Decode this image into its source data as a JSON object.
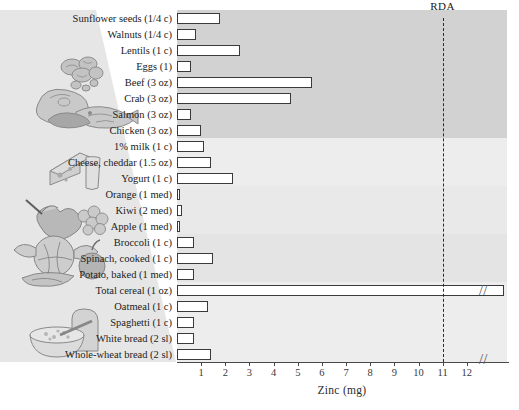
{
  "chart_data": {
    "type": "bar",
    "orientation": "horizontal",
    "title": "",
    "xlabel": "Zinc (mg)",
    "ylabel": "",
    "xlim": [
      0,
      13
    ],
    "xticks": [
      1,
      2,
      3,
      4,
      5,
      6,
      7,
      8,
      9,
      10,
      11,
      12
    ],
    "grid": false,
    "legend": null,
    "axis_break": true,
    "axis_break_note": "//",
    "annotations": [
      {
        "label": "RDA",
        "type": "vertical-line",
        "value": 11,
        "style": "dashed"
      }
    ],
    "categories": [
      "Sunflower seeds (1/4 c)",
      "Walnuts (1/4 c)",
      "Lentils (1 c)",
      "Eggs (1)",
      "Beef (3 oz)",
      "Crab (3 oz)",
      "Salmon (3 oz)",
      "Chicken (3 oz)",
      "1% milk (1 c)",
      "Cheese, cheddar (1.5 oz)",
      "Yogurt (1 c)",
      "Orange (1 med)",
      "Kiwi (2 med)",
      "Apple (1 med)",
      "Broccoli (1 c)",
      "Spinach, cooked (1 c)",
      "Potato, baked (1 med)",
      "Total cereal (1 oz)",
      "Oatmeal (1 c)",
      "Spaghetti (1 c)",
      "White bread (2 sl)",
      "Whole-wheat bread (2 sl)"
    ],
    "values": [
      1.8,
      0.8,
      2.6,
      0.6,
      5.6,
      4.7,
      0.6,
      1.0,
      1.1,
      1.4,
      2.3,
      0.1,
      0.2,
      0.1,
      0.7,
      1.5,
      0.7,
      15.0,
      1.3,
      0.7,
      0.7,
      1.4
    ],
    "group_bands": [
      {
        "name": "protein-foods",
        "rows": [
          0,
          7
        ],
        "shade": "dark"
      },
      {
        "name": "dairy",
        "rows": [
          8,
          10
        ],
        "shade": "light"
      },
      {
        "name": "fruits",
        "rows": [
          11,
          13
        ],
        "shade": "lighter"
      },
      {
        "name": "vegetables",
        "rows": [
          14,
          16
        ],
        "shade": "mid"
      },
      {
        "name": "grains",
        "rows": [
          17,
          21
        ],
        "shade": "light"
      }
    ]
  },
  "axis": {
    "xlabel": "Zinc (mg)",
    "ticklabels": [
      "1",
      "2",
      "3",
      "4",
      "5",
      "6",
      "7",
      "8",
      "9",
      "10",
      "11",
      "12"
    ],
    "break_glyph": "//"
  },
  "rda": {
    "label": "RDA",
    "value": 11
  },
  "illustrations": [
    {
      "name": "nuts-seeds-illustration"
    },
    {
      "name": "meat-fish-illustration"
    },
    {
      "name": "cheese-milk-illustration"
    },
    {
      "name": "fruit-illustration"
    },
    {
      "name": "vegetables-illustration"
    },
    {
      "name": "bread-cereal-illustration"
    }
  ],
  "colors": {
    "bar_fill": "#ffffff",
    "bar_stroke": "#3a3a3a",
    "band_dark": "#d2d2d2",
    "band_light": "#ededed",
    "axis": "#4a4a4a",
    "rda_line": "#2a2a2a"
  }
}
